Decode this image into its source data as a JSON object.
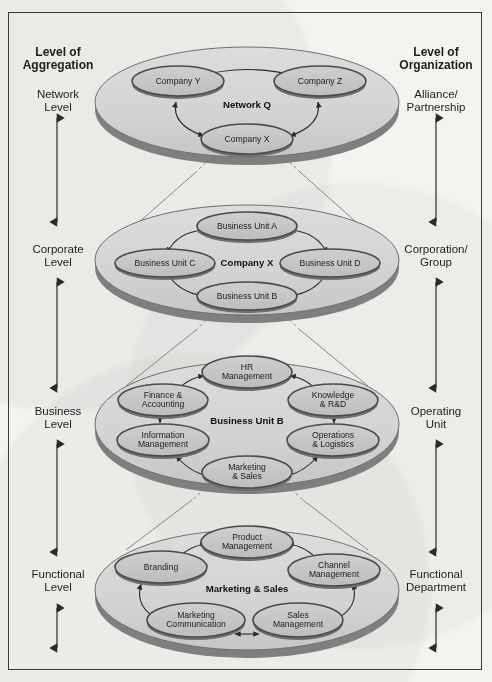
{
  "figure": {
    "title": "",
    "colors": {
      "page_background": "#f4f3f0",
      "frame_border": "#3a3a3a",
      "disc_top": "#d6d6d6",
      "disc_rim": "#8c8c8c",
      "disc_outline": "#6f6f6f",
      "node_fill": "#c9c9c9",
      "node_ring": "#555555",
      "arrow": "#2a2a2a",
      "connector": "#6a6a6a",
      "text": "#1b1b1b"
    }
  },
  "axes": {
    "left": {
      "header_line1": "Level of",
      "header_line2": "Aggregation",
      "labels": [
        {
          "line1": "Network",
          "line2": "Level"
        },
        {
          "line1": "Corporate",
          "line2": "Level"
        },
        {
          "line1": "Business",
          "line2": "Level"
        },
        {
          "line1": "Functional",
          "line2": "Level"
        }
      ]
    },
    "right": {
      "header_line1": "Level of",
      "header_line2": "Organization",
      "labels": [
        {
          "line1": "Alliance/",
          "line2": "Partnership"
        },
        {
          "line1": "Corporation/",
          "line2": "Group"
        },
        {
          "line1": "Operating",
          "line2": "Unit"
        },
        {
          "line1": "Functional",
          "line2": "Department"
        }
      ]
    }
  },
  "levels": [
    {
      "id": "network",
      "center_label": "Network Q",
      "nodes": [
        {
          "id": "company-y",
          "line1": "Company Y",
          "line2": ""
        },
        {
          "id": "company-z",
          "line1": "Company Z",
          "line2": ""
        },
        {
          "id": "company-x",
          "line1": "Company X",
          "line2": ""
        }
      ]
    },
    {
      "id": "corporate",
      "center_label": "Company X",
      "nodes": [
        {
          "id": "business-unit-a",
          "line1": "Business Unit A",
          "line2": ""
        },
        {
          "id": "business-unit-c",
          "line1": "Business Unit C",
          "line2": ""
        },
        {
          "id": "business-unit-d",
          "line1": "Business Unit D",
          "line2": ""
        },
        {
          "id": "business-unit-b",
          "line1": "Business Unit B",
          "line2": ""
        }
      ]
    },
    {
      "id": "business",
      "center_label": "Business Unit B",
      "nodes": [
        {
          "id": "hr-management",
          "line1": "HR",
          "line2": "Management"
        },
        {
          "id": "finance-accounting",
          "line1": "Finance &",
          "line2": "Accounting"
        },
        {
          "id": "knowledge-rd",
          "line1": "Knowledge",
          "line2": "& R&D"
        },
        {
          "id": "information-management",
          "line1": "Information",
          "line2": "Management"
        },
        {
          "id": "operations-logistics",
          "line1": "Operations",
          "line2": "& Logistics"
        },
        {
          "id": "marketing-sales",
          "line1": "Marketing",
          "line2": "& Sales"
        }
      ]
    },
    {
      "id": "functional",
      "center_label": "Marketing & Sales",
      "nodes": [
        {
          "id": "product-management",
          "line1": "Product",
          "line2": "Management"
        },
        {
          "id": "branding",
          "line1": "Branding",
          "line2": ""
        },
        {
          "id": "channel-management",
          "line1": "Channel",
          "line2": "Management"
        },
        {
          "id": "marketing-communication",
          "line1": "Marketing",
          "line2": "Communication"
        },
        {
          "id": "sales-management",
          "line1": "Sales",
          "line2": "Management"
        }
      ]
    }
  ]
}
